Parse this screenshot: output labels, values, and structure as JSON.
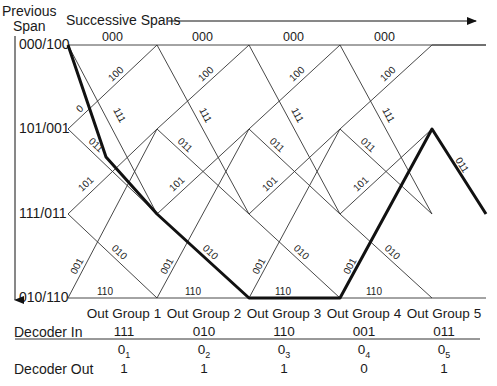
{
  "header": {
    "previous_span_line1": "Previous",
    "previous_span_line2": "Span",
    "successive_spans": "Successive Spans"
  },
  "states": [
    "000/100",
    "101/001",
    "111/011",
    "010/110"
  ],
  "branch_labels": {
    "top": "000",
    "down_from_top": "111",
    "up_to_top": "100",
    "start_small": "0",
    "from_101": "011",
    "up_to_101": "101",
    "down_to_010": "010",
    "up_from_010": "001",
    "bottom": "110"
  },
  "table": {
    "row_labels": {
      "groups": "",
      "decoder_in": "Decoder In",
      "decoder_out": "Decoder Out"
    },
    "columns": [
      {
        "group": "Out Group 1",
        "decoder_in": "111",
        "o_label": "0",
        "o_sub": "1",
        "decoder_out": "1"
      },
      {
        "group": "Out Group 2",
        "decoder_in": "010",
        "o_label": "0",
        "o_sub": "2",
        "decoder_out": "1"
      },
      {
        "group": "Out Group 3",
        "decoder_in": "110",
        "o_label": "0",
        "o_sub": "3",
        "decoder_out": "1"
      },
      {
        "group": "Out Group 4",
        "decoder_in": "001",
        "o_label": "0",
        "o_sub": "4",
        "decoder_out": "0"
      },
      {
        "group": "Out Group 5",
        "decoder_in": "011",
        "o_label": "0",
        "o_sub": "5",
        "decoder_out": "1"
      }
    ]
  },
  "decoded_path_states": [
    "000/100",
    "111/011",
    "010/110",
    "010/110",
    "101/001",
    "111/011"
  ]
}
